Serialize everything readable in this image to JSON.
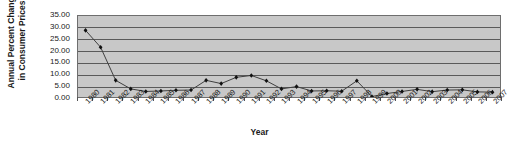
{
  "chart_data": {
    "type": "line",
    "title": "",
    "xlabel": "Year",
    "ylabel": "Annual Percent Change\nin Consumer Prices",
    "ylim": [
      0,
      35
    ],
    "ytick_step": 5,
    "ytick_labels": [
      "35.00",
      "30.00",
      "25.00",
      "20.00",
      "15.00",
      "10.00",
      "5.00",
      "0.00"
    ],
    "ytick_values": [
      35,
      30,
      25,
      20,
      15,
      10,
      5,
      0
    ],
    "grid": true,
    "legend": "none",
    "marker": "diamond",
    "categories": [
      "1980",
      "1981",
      "1982",
      "1983",
      "1984",
      "1985",
      "1986",
      "1987",
      "1988",
      "1989",
      "1990",
      "1991",
      "1992",
      "1993",
      "1994",
      "1995",
      "1996",
      "1997",
      "1998",
      "1999",
      "2000",
      "2001",
      "2002",
      "2003",
      "2004",
      "2005",
      "2006",
      "2007"
    ],
    "values": [
      28.8,
      21.5,
      7.2,
      3.5,
      2.4,
      2.6,
      2.9,
      3.0,
      7.2,
      5.8,
      8.5,
      9.3,
      7.0,
      3.5,
      4.5,
      2.6,
      2.7,
      2.5,
      7.0,
      0.2,
      1.5,
      2.4,
      3.3,
      2.3,
      3.0,
      3.1,
      2.2,
      2.1
    ],
    "series_name": "Annual Percent Change in Consumer Prices"
  },
  "colors": {
    "plot_background": "#c8c8c8",
    "gridline": "#5a5a5a",
    "series_line": "#404040",
    "marker": "#111111",
    "axis": "#6e6e6e",
    "text": "#1a1a1a",
    "page_background": "#ffffff"
  }
}
